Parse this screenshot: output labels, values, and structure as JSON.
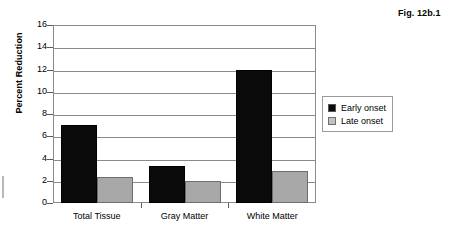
{
  "figure": {
    "caption": "Fig. 12b.1"
  },
  "chart_data": {
    "type": "bar",
    "title": "",
    "xlabel": "",
    "ylabel": "Percent Reduction",
    "categories": [
      "Total Tissue",
      "Gray Matter",
      "White Matter"
    ],
    "series": [
      {
        "name": "Early onset",
        "values": [
          7.0,
          3.3,
          12.0
        ],
        "color": "#0a0a0a"
      },
      {
        "name": "Late onset",
        "values": [
          2.3,
          2.0,
          2.9
        ],
        "color": "#a8a8a8"
      }
    ],
    "ylim": [
      0,
      16
    ],
    "yticks": [
      0,
      2,
      4,
      6,
      8,
      10,
      12,
      14,
      16
    ],
    "ytick_labels": [
      "0",
      "2",
      "4",
      "6",
      "8",
      "10",
      "12",
      "14",
      "16"
    ],
    "grid": true,
    "legend_position": "right"
  }
}
